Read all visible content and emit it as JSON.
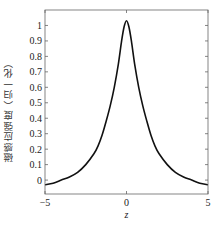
{
  "chart_data": {
    "type": "line",
    "title": "",
    "xlabel": "z",
    "ylabel": "磁感应强度（归一化）",
    "xlim": [
      -5,
      5
    ],
    "ylim": [
      -0.09,
      1.1
    ],
    "xticks": [
      -5,
      0,
      5
    ],
    "xtick_labels": [
      "−5",
      "0",
      "5"
    ],
    "yticks": [
      0,
      0.1,
      0.2,
      0.3,
      0.4,
      0.5,
      0.6,
      0.7,
      0.8,
      0.9,
      1
    ],
    "ytick_labels": [
      "0",
      "0.1",
      "0.2",
      "0.3",
      "0.4",
      "0.5",
      "0.6",
      "0.7",
      "0.8",
      "0.9",
      "1"
    ],
    "grid": false,
    "legend": null,
    "series": [
      {
        "name": "B(z)",
        "color": "#111111",
        "x": [
          -5,
          -4.5,
          -4,
          -3.5,
          -3,
          -2.5,
          -2,
          -1.75,
          -1.5,
          -1.25,
          -1,
          -0.75,
          -0.5,
          -0.3,
          -0.15,
          0,
          0.15,
          0.3,
          0.5,
          0.75,
          1,
          1.25,
          1.5,
          1.75,
          2,
          2.5,
          3,
          3.5,
          4,
          4.5,
          5
        ],
        "y": [
          -0.03,
          -0.02,
          0.0,
          0.02,
          0.05,
          0.1,
          0.17,
          0.22,
          0.29,
          0.38,
          0.48,
          0.6,
          0.75,
          0.9,
          0.99,
          1.03,
          0.99,
          0.9,
          0.75,
          0.6,
          0.48,
          0.38,
          0.29,
          0.22,
          0.17,
          0.1,
          0.05,
          0.02,
          0.0,
          -0.02,
          -0.03
        ]
      }
    ]
  }
}
